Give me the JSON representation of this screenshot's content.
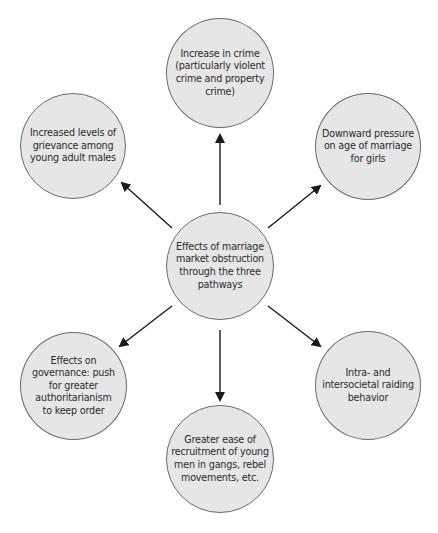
{
  "diagram": {
    "type": "hub-and-spoke",
    "colors": {
      "node_fill": "#e6e6e6",
      "node_border": "#6a6a6a",
      "text": "#2a2a2a",
      "arrow": "#1a1a1a"
    },
    "center": {
      "label": "Effects of marriage\nmarket obstruction\nthrough the three\npathways"
    },
    "outcomes": [
      {
        "position": "top",
        "label": "Increase in crime\n(particularly violent\ncrime and property\ncrime)"
      },
      {
        "position": "top-left",
        "label": "Increased levels of\ngrievance among\nyoung adult males"
      },
      {
        "position": "top-right",
        "label": "Downward pressure\non age of marriage\nfor girls"
      },
      {
        "position": "bottom-left",
        "label": "Effects on\ngovernance: push\nfor greater\nauthoritarianism\nto keep order"
      },
      {
        "position": "bottom-right",
        "label": "Intra- and\nintersocietal raiding\nbehavior"
      },
      {
        "position": "bottom",
        "label": "Greater ease of\nrecruitment of young\nmen in gangs, rebel\nmovements, etc."
      }
    ]
  }
}
